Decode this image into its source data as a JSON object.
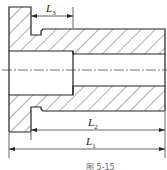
{
  "figure": {
    "caption": "图 5-15",
    "dimensions": [
      {
        "id": "L3",
        "label_main": "L",
        "label_sub": "3"
      },
      {
        "id": "L2",
        "label_main": "L",
        "label_sub": "2"
      },
      {
        "id": "L1",
        "label_main": "L",
        "label_sub": "1"
      }
    ],
    "colors": {
      "line": "#222222",
      "hatch": "#333333",
      "background": "#ffffff"
    }
  }
}
